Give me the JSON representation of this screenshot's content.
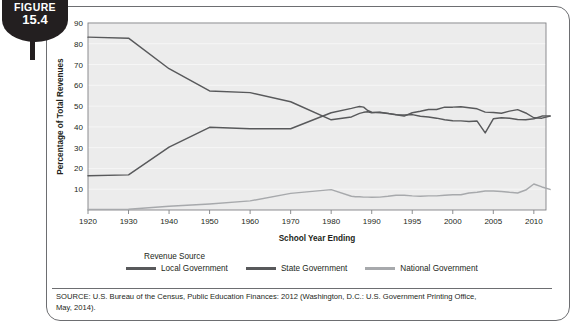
{
  "figure": {
    "label": "FIGURE",
    "number": "15.4"
  },
  "legend": {
    "title": "Revenue Source",
    "entries": [
      {
        "name": "Local Government",
        "color": "#58595b"
      },
      {
        "name": "State Government",
        "color": "#58595b"
      },
      {
        "name": "National Government",
        "color": "#a7a9ac"
      }
    ]
  },
  "source": {
    "line1": "SOURCE: U.S. Bureau of the Census, Public Education Finances: 2012 (Washington, D.C.: U.S. Government Printing Office,",
    "line2": "May, 2014)."
  },
  "chart_data": {
    "type": "line",
    "title": "",
    "xlabel": "School Year Ending",
    "ylabel": "Percentage of Total Revenues",
    "ylim": [
      0,
      90
    ],
    "yticks": [
      10,
      20,
      30,
      40,
      50,
      60,
      70,
      80,
      90
    ],
    "xticks": [
      "1920",
      "1930",
      "1940",
      "1950",
      "1960",
      "1970",
      "1980",
      "1990",
      "1995",
      "2000",
      "2005",
      "2010"
    ],
    "grid": true,
    "legend_position": "bottom",
    "plot_bg": "#ececec",
    "x": [
      1920,
      1930,
      1940,
      1950,
      1960,
      1970,
      1980,
      1985,
      1986,
      1987,
      1988,
      1989,
      1990,
      1991,
      1992,
      1993,
      1994,
      1995,
      1996,
      1997,
      1998,
      1999,
      2000,
      2001,
      2002,
      2003,
      2004,
      2005,
      2006,
      2007,
      2008,
      2009,
      2010,
      2011,
      2012
    ],
    "series": [
      {
        "name": "Local Government",
        "color": "#58595b",
        "values": [
          83.2,
          82.7,
          68.0,
          57.3,
          56.5,
          52.1,
          43.4,
          44.8,
          45.7,
          46.5,
          47.0,
          47.3,
          46.8,
          47.0,
          46.5,
          45.9,
          45.7,
          45.9,
          45.1,
          44.8,
          44.2,
          43.4,
          43.0,
          42.9,
          42.6,
          42.8,
          37.1,
          43.9,
          44.4,
          44.2,
          43.6,
          43.4,
          43.9,
          45.2,
          45.3
        ]
      },
      {
        "name": "State Government",
        "color": "#58595b",
        "values": [
          16.5,
          16.9,
          30.3,
          39.8,
          39.1,
          39.1,
          46.8,
          48.9,
          49.4,
          49.8,
          49.5,
          47.9,
          47.1,
          46.9,
          46.4,
          45.8,
          45.2,
          46.8,
          47.5,
          48.4,
          48.4,
          49.5,
          49.5,
          49.7,
          49.2,
          48.7,
          47.1,
          46.9,
          46.6,
          47.6,
          48.3,
          46.7,
          44.4,
          44.2,
          45.2
        ]
      },
      {
        "name": "National Government",
        "color": "#a7a9ac",
        "values": [
          0.3,
          0.4,
          1.8,
          2.9,
          4.4,
          8.0,
          9.8,
          6.6,
          6.4,
          6.4,
          6.2,
          6.2,
          6.1,
          6.2,
          6.6,
          7.1,
          7.1,
          6.8,
          6.6,
          6.8,
          6.8,
          7.1,
          7.3,
          7.3,
          8.2,
          8.5,
          9.1,
          9.1,
          8.9,
          8.5,
          8.2,
          9.6,
          12.5,
          11.1,
          9.9
        ]
      }
    ]
  }
}
